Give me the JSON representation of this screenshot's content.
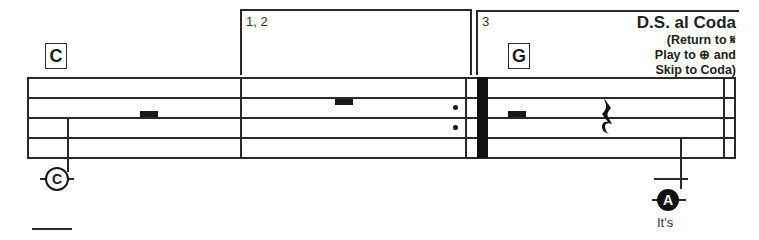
{
  "rehearsal_marks": [
    {
      "label": "C",
      "measure": 1
    },
    {
      "label": "G",
      "measure": 3
    }
  ],
  "endings": [
    {
      "label": "1, 2"
    },
    {
      "label": "3"
    }
  ],
  "navigation": {
    "title": "D.S. al Coda",
    "line1": "(Return to 𝄋",
    "line2": "Play to ⊕ and",
    "line3": "Skip to Coda)"
  },
  "note_markers": [
    {
      "label": "C",
      "style": "outlined",
      "lyric": ""
    },
    {
      "label": "A",
      "style": "filled",
      "lyric": "It's"
    }
  ],
  "icons": {
    "quarter_rest": "𝄽"
  }
}
